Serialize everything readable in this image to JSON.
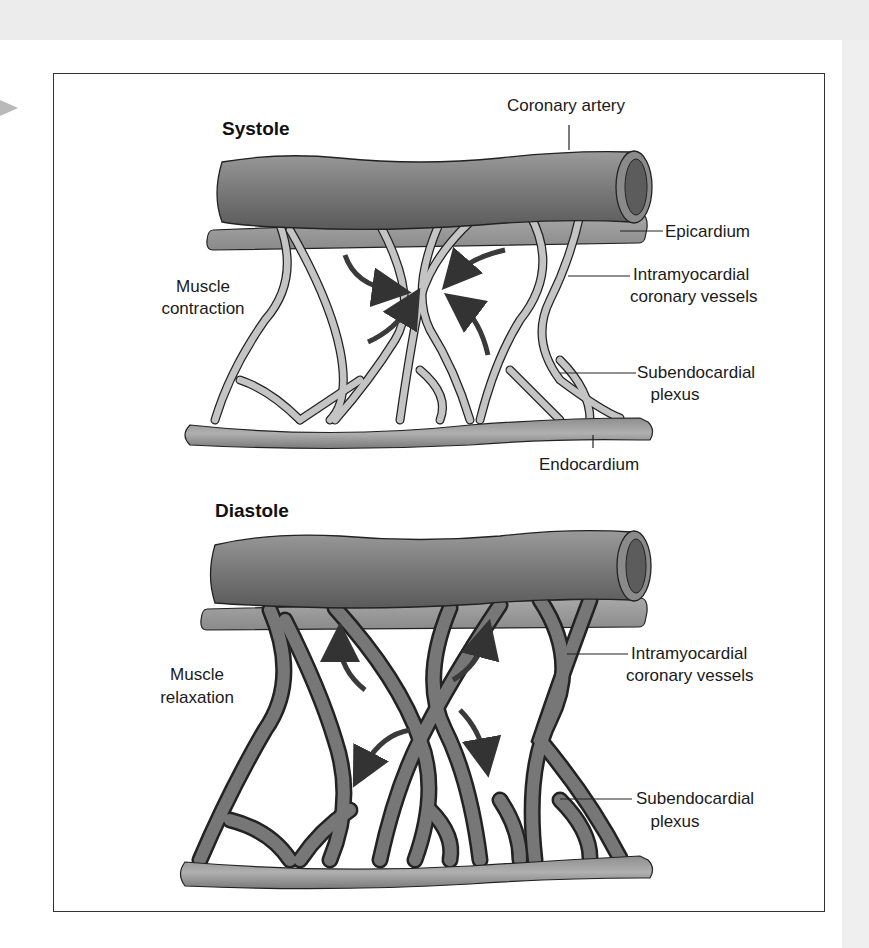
{
  "figure": {
    "panels": [
      {
        "title": "Systole",
        "side_label": [
          "Muscle",
          "contraction"
        ],
        "labels": {
          "coronary_artery": "Coronary artery",
          "epicardium": "Epicardium",
          "intramyocardial": [
            "Intramyocardial",
            "coronary vessels"
          ],
          "subendocardial": [
            "Subendocardial",
            "plexus"
          ],
          "endocardium": "Endocardium"
        },
        "vessel_state": "compressed",
        "arrow_direction": "inward"
      },
      {
        "title": "Diastole",
        "side_label": [
          "Muscle",
          "relaxation"
        ],
        "labels": {
          "intramyocardial": [
            "Intramyocardial",
            "coronary vessels"
          ],
          "subendocardial": [
            "Subendocardial",
            "plexus"
          ]
        },
        "vessel_state": "dilated",
        "arrow_direction": "outward"
      }
    ],
    "colors": {
      "artery": "#7a7a7a",
      "vessel_light": "#bdbdbd",
      "vessel_dark": "#6e6e6e",
      "outline": "#222222",
      "arrow": "#3a3a3a",
      "frame": "#333333"
    }
  }
}
